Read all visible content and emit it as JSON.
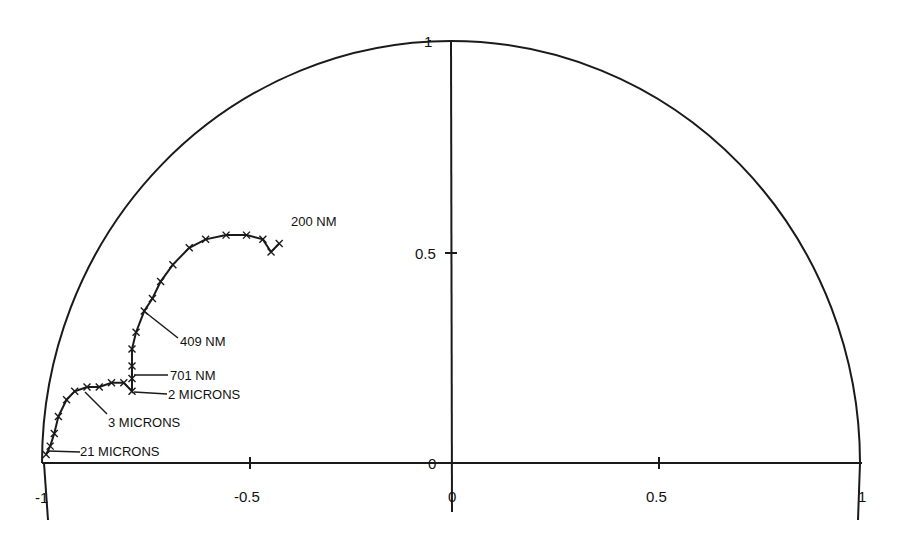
{
  "chart_data": {
    "type": "line",
    "title": "",
    "subtitle": "",
    "xlabel": "",
    "ylabel": "",
    "xlim": [
      -1,
      1
    ],
    "ylim": [
      0,
      1
    ],
    "grid": false,
    "legend": null,
    "x_ticks": [
      -1,
      -0.5,
      0,
      0.5,
      1
    ],
    "x_tick_labels": [
      "-1",
      "-0.5",
      "0",
      "0.5",
      "1"
    ],
    "y_ticks": [
      0,
      0.5,
      1
    ],
    "y_tick_labels": [
      "0",
      "0.5",
      "1"
    ],
    "boundary": {
      "shape": "unit semicircle",
      "center": [
        0,
        0
      ],
      "radius": 1
    },
    "series": [
      {
        "name": "trajectory",
        "marker": "x",
        "points": [
          {
            "x": -0.42,
            "y": 0.52
          },
          {
            "x": -0.44,
            "y": 0.5
          },
          {
            "x": -0.46,
            "y": 0.53
          },
          {
            "x": -0.5,
            "y": 0.54
          },
          {
            "x": -0.55,
            "y": 0.54
          },
          {
            "x": -0.6,
            "y": 0.53
          },
          {
            "x": -0.64,
            "y": 0.51
          },
          {
            "x": -0.68,
            "y": 0.47
          },
          {
            "x": -0.71,
            "y": 0.43
          },
          {
            "x": -0.73,
            "y": 0.39
          },
          {
            "x": -0.75,
            "y": 0.36
          },
          {
            "x": -0.77,
            "y": 0.31
          },
          {
            "x": -0.78,
            "y": 0.27
          },
          {
            "x": -0.78,
            "y": 0.23
          },
          {
            "x": -0.78,
            "y": 0.2
          },
          {
            "x": -0.78,
            "y": 0.17
          },
          {
            "x": -0.8,
            "y": 0.19
          },
          {
            "x": -0.83,
            "y": 0.19
          },
          {
            "x": -0.86,
            "y": 0.18
          },
          {
            "x": -0.89,
            "y": 0.18
          },
          {
            "x": -0.92,
            "y": 0.17
          },
          {
            "x": -0.94,
            "y": 0.15
          },
          {
            "x": -0.96,
            "y": 0.11
          },
          {
            "x": -0.97,
            "y": 0.07
          },
          {
            "x": -0.98,
            "y": 0.04
          },
          {
            "x": -0.99,
            "y": 0.02
          }
        ]
      }
    ],
    "annotations": [
      {
        "text": "200 NM",
        "x": -0.44,
        "y": 0.5
      },
      {
        "text": "409 NM",
        "x": -0.75,
        "y": 0.36
      },
      {
        "text": "701 NM",
        "x": -0.78,
        "y": 0.2
      },
      {
        "text": "2 MICRONS",
        "x": -0.78,
        "y": 0.17
      },
      {
        "text": "3 MICRONS",
        "x": -0.89,
        "y": 0.18
      },
      {
        "text": "21 MICRONS",
        "x": -0.98,
        "y": 0.03
      }
    ]
  },
  "axes": {
    "x_labels": {
      "neg1": "-1",
      "neg05": "-0.5",
      "zero": "0",
      "pos05": "0.5",
      "pos1": "1"
    },
    "y_labels": {
      "zero": "0",
      "half": "0.5",
      "one": "1"
    }
  },
  "labels": {
    "l200": "200 NM",
    "l409": "409 NM",
    "l701": "701 NM",
    "l2u": "2 MICRONS",
    "l3u": "3 MICRONS",
    "l21u": "21 MICRONS"
  },
  "colors": {
    "ink": "#1a1a1a",
    "background": "#ffffff"
  }
}
